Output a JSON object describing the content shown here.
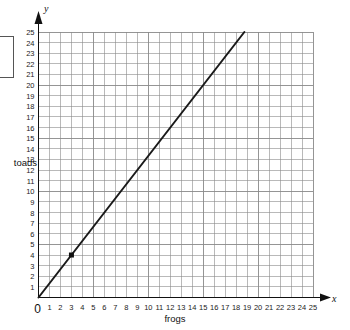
{
  "chart_data": {
    "type": "line",
    "title": "",
    "xlabel": "frogs",
    "ylabel": "toads",
    "x_axis_symbol": "x",
    "y_axis_symbol": "y",
    "xlim": [
      0,
      25
    ],
    "ylim": [
      0,
      25
    ],
    "grid": true,
    "grid_step": 1,
    "origin_label": "0",
    "legend": null,
    "xticks": [
      0,
      1,
      2,
      3,
      4,
      5,
      6,
      7,
      8,
      9,
      10,
      11,
      12,
      13,
      14,
      15,
      16,
      17,
      18,
      19,
      20,
      21,
      22,
      23,
      24,
      25
    ],
    "yticks": [
      1,
      2,
      3,
      4,
      5,
      6,
      7,
      8,
      9,
      10,
      11,
      12,
      13,
      14,
      15,
      16,
      17,
      18,
      19,
      20,
      21,
      22,
      23,
      24,
      25
    ],
    "series": [
      {
        "name": "toads per frogs",
        "type": "line",
        "x": [
          0,
          18.75
        ],
        "y": [
          0,
          25
        ],
        "slope": 1.3333,
        "intercept": 0,
        "color": "#1a1a1a",
        "width": 2
      }
    ],
    "points": [
      {
        "x": 3,
        "y": 4,
        "marker": "square",
        "color": "#111111",
        "label": ""
      }
    ],
    "colors": {
      "grid": "#8a8a8a",
      "axis": "#111111",
      "line": "#1a1a1a",
      "point": "#111111",
      "background": "#ffffff"
    }
  },
  "annotations": {
    "left_box": ""
  }
}
